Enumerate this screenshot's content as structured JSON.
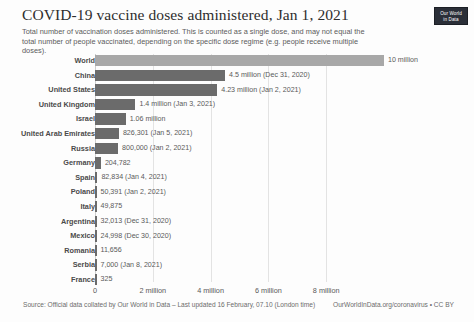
{
  "header": {
    "title": "COVID-19 vaccine doses administered, Jan 1, 2021",
    "subtitle": "Total number of vaccination doses administered. This is counted as a single dose, and may not equal the total number of people vaccinated, depending on the specific dose regime (e.g. people receive multiple doses).",
    "logo_line1": "Our World",
    "logo_line2": "in Data"
  },
  "footer": {
    "source": "Source: Official data collated by Our World in Data – Last updated 16 February, 07.10 (London time)",
    "link": "OurWorldInData.org/coronavirus • CC BY"
  },
  "colors": {
    "world_bar": "#a8a8a8",
    "country_bar": "#6b6b6b",
    "gridline": "#e3e3e3",
    "text": "#4a4a4a",
    "logo_background": "#2b2f38"
  },
  "chart_data": {
    "type": "bar",
    "orientation": "horizontal",
    "title": "COVID-19 vaccine doses administered, Jan 1, 2021",
    "subtitle": "Total number of vaccination doses administered. This is counted as a single dose, and may not equal the total number of people vaccinated, depending on the specific dose regime (e.g. people receive multiple doses).",
    "xlabel": "",
    "ylabel": "",
    "xlim": [
      0,
      10000000
    ],
    "grid": true,
    "legend": false,
    "tick_labels": [
      "0",
      "2 million",
      "4 million",
      "6 million",
      "8 million"
    ],
    "tick_values": [
      0,
      2000000,
      4000000,
      6000000,
      8000000
    ],
    "categories": [
      "World",
      "China",
      "United States",
      "United Kingdom",
      "Israel",
      "United Arab Emirates",
      "Russia",
      "Germany",
      "Spain",
      "Poland",
      "Italy",
      "Argentina",
      "Mexico",
      "Romania",
      "Serbia",
      "France"
    ],
    "values": [
      10000000,
      4500000,
      4230000,
      1400000,
      1060000,
      826301,
      800000,
      204782,
      82834,
      50391,
      49875,
      32013,
      24998,
      11656,
      7000,
      325
    ],
    "value_labels": [
      "10 million",
      "4.5 million (Dec 31, 2020)",
      "4.23 million (Jan 2, 2021)",
      "1.4 million (Jan 3, 2021)",
      "1.06 million",
      "826,301 (Jan 5, 2021)",
      "800,000 (Jan 2, 2021)",
      "204,782",
      "82,834 (Jan 4, 2021)",
      "50,391 (Jan 2, 2021)",
      "49,875",
      "32,013 (Dec 31, 2020)",
      "24,998 (Dec 30, 2020)",
      "11,656",
      "7,000 (Jan 8, 2021)",
      "325"
    ]
  }
}
